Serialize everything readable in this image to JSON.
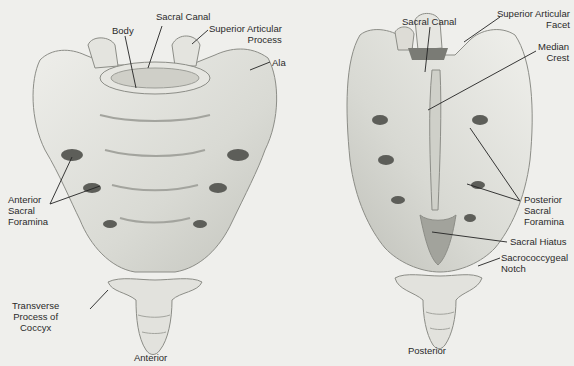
{
  "figure": {
    "views": [
      {
        "id": "anterior",
        "title": "Anterior",
        "labels": [
          {
            "id": "sacral-canal-a",
            "text": "Sacral Canal"
          },
          {
            "id": "body",
            "text": "Body"
          },
          {
            "id": "superior-articular-process",
            "text": "Superior Articular\nProcess"
          },
          {
            "id": "ala",
            "text": "Ala"
          },
          {
            "id": "anterior-sacral-foramina",
            "text": "Anterior\nSacral\nForamina"
          },
          {
            "id": "transverse-process-coccyx",
            "text": "Transverse\nProcess of\nCoccyx"
          }
        ]
      },
      {
        "id": "posterior",
        "title": "Posterior",
        "labels": [
          {
            "id": "sacral-canal-p",
            "text": "Sacral Canal"
          },
          {
            "id": "superior-articular-facet",
            "text": "Superior Articular\nFacet"
          },
          {
            "id": "median-crest",
            "text": "Median\nCrest"
          },
          {
            "id": "posterior-sacral-foramina",
            "text": "Posterior\nSacral\nForamina"
          },
          {
            "id": "sacral-hiatus",
            "text": "Sacral Hiatus"
          },
          {
            "id": "sacrococcygeal-notch",
            "text": "Sacrococcygeal\nNotch"
          }
        ]
      }
    ],
    "colors": {
      "background": "#efefec",
      "bone": "#dedfd9",
      "bone_shadow": "#b9bab3",
      "outline": "#8c8d87",
      "leader": "#222222"
    }
  }
}
